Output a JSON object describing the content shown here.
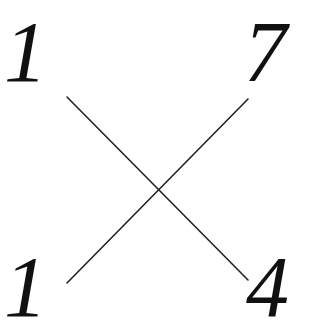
{
  "diagram": {
    "type": "cross-multiplication",
    "numbers": {
      "top_left": "1",
      "top_right": "7",
      "bottom_left": "1",
      "bottom_right": "4"
    },
    "connections": [
      {
        "from": "top_left",
        "to": "bottom_right"
      },
      {
        "from": "top_right",
        "to": "bottom_left"
      }
    ],
    "colors": {
      "text": "#111111",
      "line": "#222222",
      "background": "#ffffff"
    }
  }
}
